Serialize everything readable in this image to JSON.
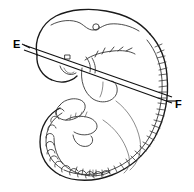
{
  "figure": {
    "background_color": "#ffffff",
    "ink_color": "#1a1a1a",
    "width": 194,
    "height": 192
  },
  "labels": [
    {
      "id": "E",
      "text": "E",
      "x": 13,
      "y": 39,
      "role": "section-plane-left-marker"
    },
    {
      "id": "F",
      "text": "F",
      "x": 175,
      "y": 99,
      "role": "section-plane-right-marker"
    }
  ],
  "section_plane": {
    "name": "E-F",
    "line_count": 2,
    "left_label": "E",
    "right_label": "F",
    "lines": [
      {
        "x1": 24,
        "y1": 45,
        "x2": 172,
        "y2": 97
      },
      {
        "x1": 24,
        "y1": 50,
        "x2": 172,
        "y2": 103
      }
    ],
    "leader_left": {
      "x1": 22,
      "y1": 44,
      "x2": 28,
      "y2": 47
    },
    "leader_right": {
      "x1": 168,
      "y1": 100,
      "x2": 174,
      "y2": 101
    }
  },
  "structures": [
    {
      "name": "head-outline",
      "description": "large rounded cranial region, upper left"
    },
    {
      "name": "otic-vesicle",
      "description": "small circle in dorsal head",
      "cx": 96,
      "cy": 27,
      "r": 3.2
    },
    {
      "name": "optic-vesicle",
      "description": "eye, lower left of head"
    },
    {
      "name": "pharyngeal-arches",
      "description": "branching comb-like marks, mid body"
    },
    {
      "name": "heart-bulge",
      "description": "rounded prominence below arches"
    },
    {
      "name": "limb-bud",
      "description": "small lobed projection, lower left"
    },
    {
      "name": "somites-dorsal",
      "description": "tick marks along right dorsal flank"
    },
    {
      "name": "tail-scallops",
      "description": "beaded somite row along curved tail"
    },
    {
      "name": "body-outline",
      "description": "C-shaped trunk and tail outline"
    }
  ]
}
